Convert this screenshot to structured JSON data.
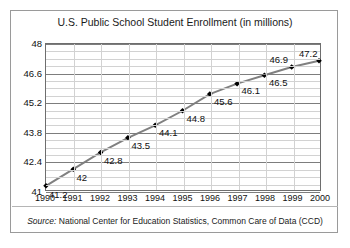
{
  "card": {
    "title": "U.S. Public School Student Enrollment (in millions)",
    "caption_source_label": "Source:",
    "caption_text": "National Center for Education Statistics, Common Care of Data (CCD)"
  },
  "chart_data": {
    "type": "line",
    "title": "U.S. Public School Student Enrollment (in millions)",
    "xlabel": "",
    "ylabel": "",
    "categories": [
      "1990",
      "1991",
      "1992",
      "1993",
      "1994",
      "1995",
      "1996",
      "1997",
      "1998",
      "1999",
      "2000"
    ],
    "values": [
      41.2,
      42,
      42.8,
      43.5,
      44.1,
      44.8,
      45.6,
      46.1,
      46.5,
      46.9,
      47.2
    ],
    "point_labels": [
      "41.2",
      "42",
      "42.8",
      "43.5",
      "44.1",
      "44.8",
      "45.6",
      "46.1",
      "46.5",
      "46.9",
      "47.2"
    ],
    "ylim": [
      41,
      48
    ],
    "yticks": [
      41,
      42.4,
      43.8,
      45.2,
      46.6,
      48
    ],
    "ytick_labels": [
      "41",
      "42.4",
      "43.8",
      "45.2",
      "46.6",
      "48"
    ],
    "yminor_step": 0.35,
    "grid": true,
    "legend": "none",
    "line_color": "#808080",
    "marker_color": "#000000",
    "marker": "diamond"
  },
  "colors": {
    "border": "#9a9a9a",
    "plot_border": "#6e6e6e",
    "grid_major": "#7d7d7d",
    "grid_minor": "#d2d2d2",
    "line": "#808080",
    "text": "#111111"
  }
}
